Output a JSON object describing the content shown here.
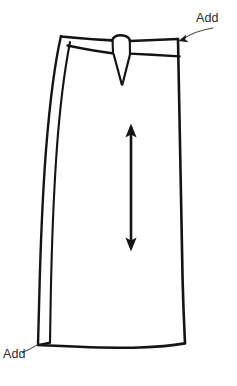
{
  "document": {
    "title": "Skirt technical sketch",
    "background_color": "#ffffff",
    "ink_color": "#141414",
    "label_color": "#2b2b2b",
    "width": 237,
    "height": 386
  },
  "annotations": [
    {
      "id": "waistband",
      "label": "Add",
      "label_position": {
        "x": 196,
        "y": 12
      },
      "leader": {
        "from": {
          "x": 212,
          "y": 27
        },
        "control": {
          "x": 196,
          "y": 30
        },
        "to": {
          "x": 180,
          "y": 40
        }
      },
      "arrowhead": true,
      "points_to": "waistband-right-corner"
    },
    {
      "id": "hem",
      "label": "Add",
      "label_position": {
        "x": 3,
        "y": 348
      },
      "leader": {
        "from": {
          "x": 22,
          "y": 352
        },
        "control": {
          "x": 30,
          "y": 350
        },
        "to": {
          "x": 38,
          "y": 344
        }
      },
      "arrowhead": false,
      "points_to": "hem-left-corner"
    }
  ],
  "grainline_arrow": {
    "name": "grainline",
    "top": {
      "x": 131,
      "y": 125
    },
    "bottom": {
      "x": 131,
      "y": 250
    },
    "double_headed": true
  },
  "garment": {
    "type": "skirt-front-panel",
    "outline": {
      "top_left": {
        "x": 61,
        "y": 36
      },
      "top_right": {
        "x": 178,
        "y": 39
      },
      "bottom_right": {
        "x": 185,
        "y": 343
      },
      "bottom_left": {
        "x": 38,
        "y": 345
      }
    },
    "waistband": {
      "top_y": 37,
      "bottom_y": 56,
      "center_notch_x": 120
    },
    "center_dart": {
      "apex": {
        "x": 122,
        "y": 84
      },
      "left": {
        "x": 113,
        "y": 55
      },
      "right": {
        "x": 130,
        "y": 55
      }
    },
    "side_seam": {
      "outer_top": {
        "x": 61,
        "y": 36
      },
      "outer_bottom": {
        "x": 38,
        "y": 345
      },
      "inner_top": {
        "x": 70,
        "y": 42
      },
      "inner_bottom": {
        "x": 50,
        "y": 342
      }
    }
  }
}
